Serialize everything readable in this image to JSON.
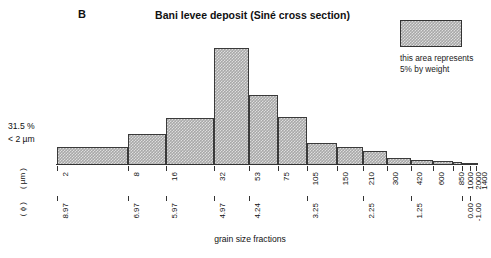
{
  "panel": {
    "label": "B"
  },
  "header": {
    "title": "Bani levee deposit (Siné cross section)"
  },
  "legend": {
    "swatch_name": "legend-swatch-hatched",
    "line1": "this area represents",
    "line2": "5% by weight",
    "fill_color": "#a8a8a8",
    "border_color": "#333333"
  },
  "annotations": {
    "clay_fraction": "31.5 %",
    "clay_size": "< 2 µm"
  },
  "axis": {
    "x_title": "grain size fractions",
    "um_caption": "( µm )",
    "phi_caption": "( ɸ )"
  },
  "chart_data": {
    "type": "bar",
    "title": "Bani levee deposit (Siné cross section)",
    "subtitle": "",
    "xlabel": "grain size fractions",
    "ylabel": "",
    "grid": false,
    "legend_position": "top-right",
    "note": "Area-proportional grain size histogram; bar area equals weight percent of each size class. Legend box area = 5% by weight.",
    "x_scale": "logarithmic grain diameter (µm) / phi units",
    "boundaries_um": [
      2,
      8,
      16,
      32,
      53,
      75,
      105,
      150,
      210,
      300,
      420,
      600,
      850,
      1000,
      1400,
      2000
    ],
    "boundaries_phi": [
      8.97,
      6.97,
      5.97,
      4.97,
      4.24,
      3.25,
      2.25,
      1.25,
      0.0,
      -1.0
    ],
    "categories": [
      "2-8",
      "8-16",
      "16-32",
      "32-53",
      "53-75",
      "75-105",
      "105-150",
      "150-210",
      "210-300",
      "300-420",
      "420-600",
      "600-850",
      "850-1000",
      "1000-1400",
      "1400-2000"
    ],
    "values": [
      31.5,
      8.0,
      12.0,
      26.0,
      10.5,
      6.5,
      2.6,
      2.2,
      1.8,
      0.7,
      0.5,
      0.4,
      0.3,
      0.2,
      0.1
    ],
    "value_units": "weight percent",
    "bars": [
      {
        "label": "2-8",
        "x0_um": 2,
        "x1_um": 8,
        "height_px": 18,
        "weight_pct": 31.5
      },
      {
        "label": "8-16",
        "x0_um": 8,
        "x1_um": 16,
        "height_px": 31,
        "weight_pct": 8.0
      },
      {
        "label": "16-32",
        "x0_um": 16,
        "x1_um": 32,
        "height_px": 47,
        "weight_pct": 12.0
      },
      {
        "label": "32-53",
        "x0_um": 32,
        "x1_um": 53,
        "height_px": 117,
        "weight_pct": 26.0
      },
      {
        "label": "53-75",
        "x0_um": 53,
        "x1_um": 75,
        "height_px": 70,
        "weight_pct": 10.5
      },
      {
        "label": "75-105",
        "x0_um": 75,
        "x1_um": 105,
        "height_px": 48,
        "weight_pct": 6.5
      },
      {
        "label": "105-150",
        "x0_um": 105,
        "x1_um": 150,
        "height_px": 22,
        "weight_pct": 2.6
      },
      {
        "label": "150-210",
        "x0_um": 150,
        "x1_um": 210,
        "height_px": 18,
        "weight_pct": 2.2
      },
      {
        "label": "210-300",
        "x0_um": 210,
        "x1_um": 300,
        "height_px": 14,
        "weight_pct": 1.8
      },
      {
        "label": "300-420",
        "x0_um": 300,
        "x1_um": 420,
        "height_px": 7,
        "weight_pct": 0.7
      },
      {
        "label": "420-600",
        "x0_um": 420,
        "x1_um": 600,
        "height_px": 5,
        "weight_pct": 0.5
      },
      {
        "label": "600-850",
        "x0_um": 600,
        "x1_um": 850,
        "height_px": 4,
        "weight_pct": 0.4
      },
      {
        "label": "850-1000",
        "x0_um": 850,
        "x1_um": 1000,
        "height_px": 3,
        "weight_pct": 0.3
      },
      {
        "label": "1000-1400",
        "x0_um": 1000,
        "x1_um": 1400,
        "height_px": 2,
        "weight_pct": 0.2
      },
      {
        "label": "1400-2000",
        "x0_um": 1400,
        "x1_um": 2000,
        "height_px": 2,
        "weight_pct": 0.1
      }
    ],
    "um_ticks": [
      {
        "label": "2",
        "pos_px": 1
      },
      {
        "label": "8",
        "pos_px": 72
      },
      {
        "label": "16",
        "pos_px": 110
      },
      {
        "label": "32",
        "pos_px": 158
      },
      {
        "label": "53",
        "pos_px": 193
      },
      {
        "label": "75",
        "pos_px": 222
      },
      {
        "label": "105",
        "pos_px": 251
      },
      {
        "label": "150",
        "pos_px": 281
      },
      {
        "label": "210",
        "pos_px": 307
      },
      {
        "label": "300",
        "pos_px": 331
      },
      {
        "label": "420",
        "pos_px": 355
      },
      {
        "label": "600",
        "pos_px": 377
      },
      {
        "label": "850",
        "pos_px": 397
      },
      {
        "label": "1000",
        "pos_px": 406
      },
      {
        "label": "1400",
        "pos_px": 420
      },
      {
        "label": "2000",
        "pos_px": 414
      }
    ],
    "phi_ticks": [
      {
        "label": "8.97",
        "pos_px": 1
      },
      {
        "label": "6.97",
        "pos_px": 72
      },
      {
        "label": "5.97",
        "pos_px": 110
      },
      {
        "label": "4.97",
        "pos_px": 158
      },
      {
        "label": "4.24",
        "pos_px": 193
      },
      {
        "label": "3.25",
        "pos_px": 251
      },
      {
        "label": "2.25",
        "pos_px": 307
      },
      {
        "label": "1.25",
        "pos_px": 355
      },
      {
        "label": "0.00",
        "pos_px": 406
      },
      {
        "label": "-1.00",
        "pos_px": 414
      }
    ]
  }
}
